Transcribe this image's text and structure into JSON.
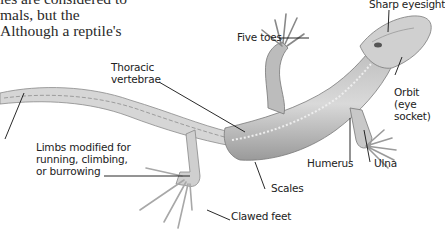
{
  "body_text": {
    "lines": [
      "                                   ",
      "les are considered to",
      "mals, but the",
      "Although a reptile's"
    ]
  },
  "figure": {
    "labels": {
      "sharp_eyesight": "Sharp eyesight",
      "five_toes": "Five toes",
      "thoracic_vertebrae_1": "Thoracic",
      "thoracic_vertebrae_2": "vertebrae",
      "orbit_1": "Orbit",
      "orbit_2": "(eye",
      "orbit_3": "socket)",
      "limbs_1": "Limbs modified for",
      "limbs_2": "running, climbing,",
      "limbs_3": "or burrowing",
      "humerus": "Humerus",
      "ulna": "Ulna",
      "scales": "Scales",
      "clawed_feet": "Clawed feet"
    }
  }
}
